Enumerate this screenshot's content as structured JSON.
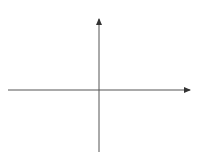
{
  "chart_data": {
    "type": "line",
    "title": "",
    "xlabel": "x",
    "ylabel": "y",
    "xlim": [
      -7,
      7
    ],
    "ylim": [
      -4.9,
      5.2
    ],
    "grid": true,
    "legend": null,
    "x_tick_labels": [
      {
        "value": -5,
        "label": "−5"
      },
      {
        "value": 5,
        "label": "5"
      }
    ],
    "y_tick_labels": [
      {
        "value": 5,
        "label": "5"
      },
      {
        "value": -5,
        "label": "−5"
      }
    ],
    "series": [
      {
        "name": "curve",
        "description": "decreasing cube-root-shaped curve, approx y = -2·cbrt(x+1) - 1, arrows on both ends",
        "x": [
          -7.8,
          -7,
          -6,
          -5,
          -4,
          -3,
          -2,
          -1.5,
          -1.1,
          -1,
          -0.9,
          -0.5,
          0,
          1,
          2,
          3,
          4,
          5,
          6,
          7.8
        ],
        "y": [
          2.8,
          2.6,
          2.4,
          2.2,
          1.9,
          1.5,
          1.0,
          0.6,
          0.1,
          -1.0,
          -2.0,
          -2.6,
          -3.0,
          -3.5,
          -3.9,
          -4.2,
          -4.4,
          -4.6,
          -4.8,
          -5.0
        ],
        "color": "#2d4fb3",
        "arrow_left": true,
        "arrow_right": true
      }
    ],
    "colors": {
      "grid": "#8fa6db",
      "axis": "#555555",
      "curve": "#2d4fb3"
    }
  }
}
